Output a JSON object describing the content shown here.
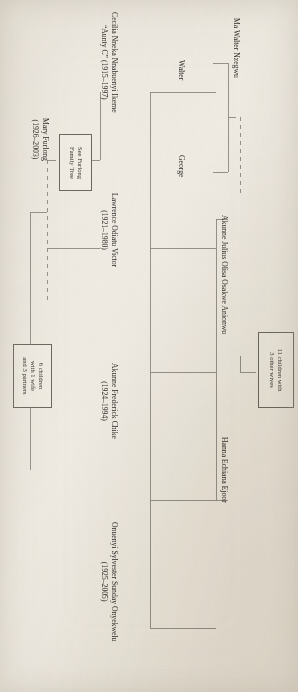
{
  "document": {
    "type": "family-tree-chart",
    "orientation": "rotated-90-clockwise",
    "background_color": "#f2efe9",
    "line_color": "#8e8b84",
    "text_color": "#33312e"
  },
  "people": {
    "ma_walter_nzegwu": {
      "name": "Ma Walter Nzegwu",
      "dates": ""
    },
    "walter": {
      "name": "Walter",
      "dates": ""
    },
    "george": {
      "name": "George",
      "dates": ""
    },
    "akunne_julius": {
      "name": "Akunne Julius Olisa Osakwe Anionwu",
      "dates": ""
    },
    "hanna_echiana_ejoor": {
      "name": "Hanna Echiana Ejoor",
      "dates": ""
    },
    "cecilia_ikeme": {
      "name": "Cecilia Nneka Nnabuenyi Ikeme",
      "dates": "“Aunty C” (1915–1997)"
    },
    "lawrence_victor": {
      "name": "Lawrence Odiatu Victor",
      "dates": "(1921–1980)"
    },
    "akunne_frederick_chike": {
      "name": "Akunne Frederick Chike",
      "dates": "(1924–1994)"
    },
    "onuenyi_sylvester": {
      "name": "Onuenyi Sylvester Sunday Onyekwelu",
      "dates": "(1925–2005)"
    },
    "mary_furlong": {
      "name": "Mary Furlong",
      "dates": "(1926–2003)"
    }
  },
  "notes": {
    "eleven_children": {
      "lines": [
        "11 children with",
        "3 other wives"
      ]
    },
    "see_furlong": {
      "lines": [
        "See Furlong",
        "Family Tree"
      ]
    },
    "six_children": {
      "lines": [
        "6 children",
        "with 1 wife",
        "and 3 partners"
      ]
    }
  }
}
